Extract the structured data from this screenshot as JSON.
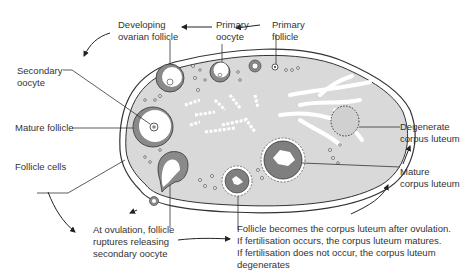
{
  "colors": {
    "stroma": "#d9d9d9",
    "capsule_stroke": "#333333",
    "follicle_fill": "#8a8a8a",
    "corpus_luteum_fill": "#7f7f7f",
    "text": "#333333",
    "background": "#ffffff"
  },
  "labels": {
    "developing_follicle": "Developing\novarian follicle",
    "primary_oocyte": "Primary\noocyte",
    "primary_follicle": "Primary\nfollicle",
    "secondary_oocyte": "Secondary\noocyte",
    "mature_follicle": "Mature follicle",
    "follicle_cells": "Follicle cells",
    "degenerate_corpus_luteum": "Degenerate\ncorpus luteum",
    "mature_corpus_luteum": "Mature\ncorpus luteum",
    "ovulation": "At ovulation, follicle\nruptures releasing\nsecondary oocyte",
    "corpus_luteum_note": "Follicle becomes the corpus luteum after ovulation.\nIf fertilisation occurs, the corpus luteum matures.\nIf fertilisation does not occur, the corpus luteum\ndegenerates"
  }
}
